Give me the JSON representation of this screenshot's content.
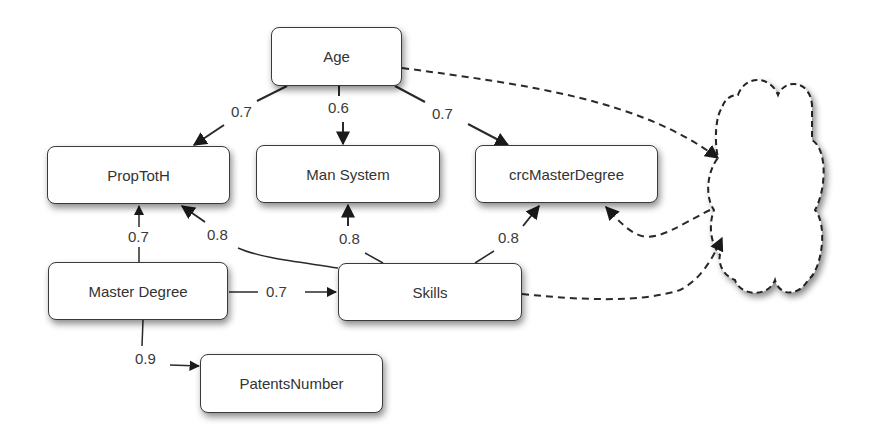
{
  "nodes": {
    "age": "Age",
    "proptoth": "PropTotH",
    "man_system": "Man System",
    "crc_master_degree": "crcMasterDegree",
    "master_degree": "Master Degree",
    "skills": "Skills",
    "patents_number": "PatentsNumber",
    "latent_cloud": ""
  },
  "edges": [
    {
      "from": "Age",
      "to": "PropTotH",
      "weight": "0.7",
      "style": "solid"
    },
    {
      "from": "Age",
      "to": "Man System",
      "weight": "0.6",
      "style": "solid"
    },
    {
      "from": "Age",
      "to": "crcMasterDegree",
      "weight": "0.7",
      "style": "solid"
    },
    {
      "from": "Master Degree",
      "to": "PropTotH",
      "weight": "0.7",
      "style": "solid"
    },
    {
      "from": "Skills",
      "to": "PropTotH",
      "weight": "0.8",
      "style": "solid"
    },
    {
      "from": "Skills",
      "to": "Man System",
      "weight": "0.8",
      "style": "solid"
    },
    {
      "from": "Skills",
      "to": "crcMasterDegree",
      "weight": "0.8",
      "style": "solid"
    },
    {
      "from": "Master Degree",
      "to": "Skills",
      "weight": "0.7",
      "style": "solid"
    },
    {
      "from": "Master Degree",
      "to": "PatentsNumber",
      "weight": "0.9",
      "style": "solid"
    },
    {
      "from": "Age",
      "to": "cloud",
      "weight": "",
      "style": "dashed"
    },
    {
      "from": "cloud",
      "to": "crcMasterDegree",
      "weight": "",
      "style": "dashed"
    },
    {
      "from": "Skills",
      "to": "cloud",
      "weight": "",
      "style": "dashed"
    }
  ],
  "colors": {
    "line": "#2a2a2a",
    "node_border": "#3a3a3a",
    "background": "#ffffff"
  }
}
